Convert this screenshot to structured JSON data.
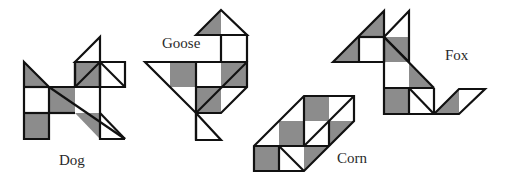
{
  "figure": {
    "fill_dark": "#8c8c8c",
    "fill_light": "#ffffff",
    "stroke": "#111111",
    "figures": [
      {
        "name": "Dog",
        "label": "Dog"
      },
      {
        "name": "Goose",
        "label": "Goose"
      },
      {
        "name": "Corn",
        "label": "Corn"
      },
      {
        "name": "Fox",
        "label": "Fox"
      }
    ]
  }
}
